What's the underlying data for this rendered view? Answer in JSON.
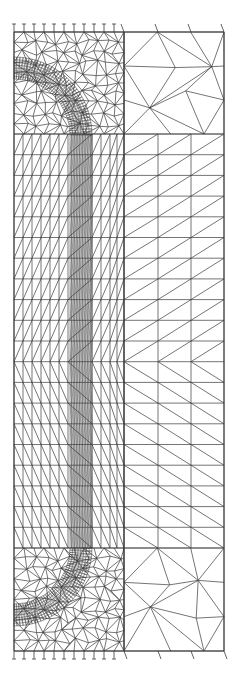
{
  "diagram": {
    "type": "finite-element-mesh",
    "stroke_color": "#3a3a3a",
    "background": "#ffffff",
    "domain": {
      "left": 14,
      "right": 224,
      "top": 32,
      "bottom": 651
    },
    "zone_divider_x": 124,
    "structured_rows": {
      "top": 134,
      "bottom": 548,
      "spacing": 20.7,
      "diagonal_flip_y": 341
    },
    "left_columns": [
      14,
      23,
      32,
      41,
      50,
      59,
      68,
      92,
      101,
      110,
      117,
      124
    ],
    "dense_band": {
      "x_from": 70,
      "x_to": 92,
      "line_count": 14
    },
    "right_columns": [
      124,
      158,
      191,
      224
    ],
    "curved_band": {
      "top": {
        "center_x": 14,
        "center_y": 135,
        "outer_r": 78,
        "inner_r": 56
      },
      "bottom": {
        "center_x": 14,
        "center_y": 548,
        "outer_r": 78,
        "inner_r": 56
      }
    },
    "supports": {
      "x_from": 14,
      "x_to": 118,
      "spacing": 10,
      "top_y": 32,
      "bottom_y": 651,
      "extra_right": [
        124,
        158,
        191,
        224
      ]
    }
  }
}
